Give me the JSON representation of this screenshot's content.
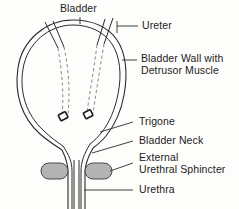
{
  "figure": {
    "background_color": "#fdfdfb",
    "line_color": "#2b2b2b",
    "sphincter_fill": "#b3b3b3",
    "orifice_fill": "#1a1a1a"
  },
  "labels": {
    "bladder": "Bladder",
    "ureter": "Ureter",
    "bladder_wall_line1": "Bladder Wall with",
    "bladder_wall_line2": "Detrusor Muscle",
    "trigone": "Trigone",
    "bladder_neck": "Bladder Neck",
    "external_sphincter_line1": "External",
    "external_sphincter_line2": "Urethral Sphincter",
    "urethra": "Urethra"
  },
  "structures": [
    {
      "name": "bladder-dome",
      "label": "Bladder"
    },
    {
      "name": "ureter-left",
      "label": "Ureter"
    },
    {
      "name": "ureter-right",
      "label": "Ureter"
    },
    {
      "name": "bladder-wall",
      "label": "Bladder Wall with Detrusor Muscle"
    },
    {
      "name": "ureteral-orifice-left",
      "label": "Ureteral orifice"
    },
    {
      "name": "ureteral-orifice-right",
      "label": "Ureteral orifice"
    },
    {
      "name": "trigone",
      "label": "Trigone"
    },
    {
      "name": "bladder-neck",
      "label": "Bladder Neck"
    },
    {
      "name": "external-urethral-sphincter",
      "label": "External Urethral Sphincter"
    },
    {
      "name": "urethra",
      "label": "Urethra"
    }
  ]
}
